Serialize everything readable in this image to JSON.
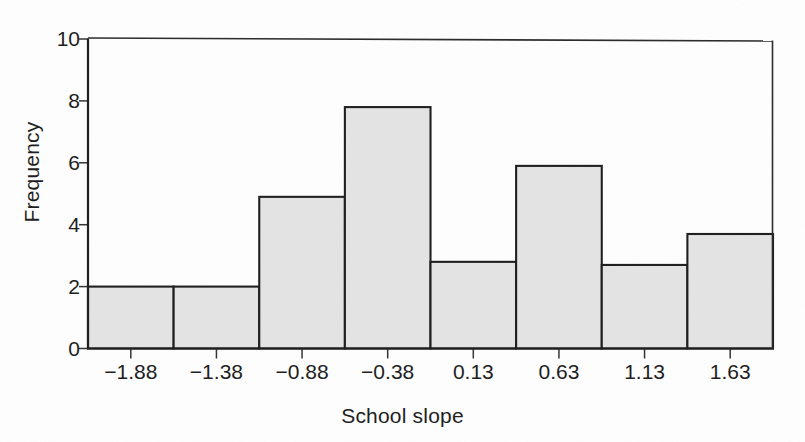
{
  "chart_data": {
    "type": "bar",
    "chart_subtype": "histogram",
    "title": "",
    "xlabel": "School slope",
    "ylabel": "Frequency",
    "categories": [
      "−1.88",
      "−1.38",
      "−0.88",
      "−0.38",
      "0.13",
      "0.63",
      "1.13",
      "1.63"
    ],
    "values": [
      2.0,
      2.0,
      4.9,
      7.8,
      2.8,
      5.9,
      2.7,
      3.7
    ],
    "bin_centers": [
      -1.88,
      -1.38,
      -0.88,
      -0.38,
      0.13,
      0.63,
      1.13,
      1.63
    ],
    "bin_width": 0.5,
    "ylim": [
      0,
      10
    ],
    "ytick_labels": [
      "0",
      "2",
      "4",
      "6",
      "8",
      "10"
    ],
    "ytick_values": [
      0,
      2,
      4,
      6,
      8,
      10
    ],
    "grid": false,
    "legend": false,
    "bar_fill_color": "#e4e4e4",
    "bar_edge_color": "#1e1e1e",
    "axis_color": "#1e1e1e",
    "background_color": "#ffffff"
  },
  "figure": {
    "axis_labels": {
      "x": "School slope",
      "y": "Frequency"
    }
  }
}
